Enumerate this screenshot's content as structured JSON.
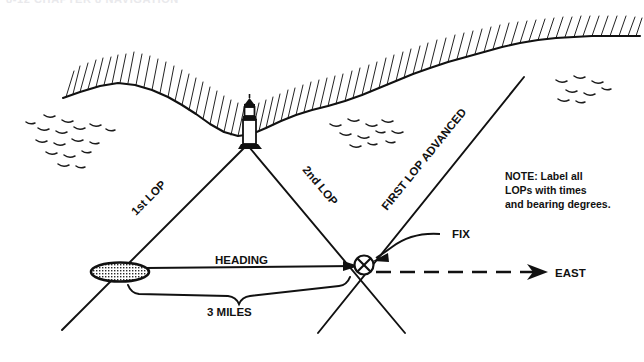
{
  "page": {
    "cut_header": "8-12   CHAPTER 8  NAVIGATION",
    "background_color": "#ffffff",
    "ink_color": "#111111"
  },
  "diagram": {
    "labels": {
      "lop1": "1st LOP",
      "lop2": "2nd LOP",
      "lop_advanced": "FIRST LOP ADVANCED",
      "heading": "HEADING",
      "distance": "3 MILES",
      "fix": "FIX",
      "east": "EAST"
    },
    "note": {
      "line1": "NOTE: Label all",
      "line2": "LOPs with times",
      "line3": "and bearing degrees."
    },
    "features": {
      "lighthouse": "lighthouse-icon",
      "ship": "ship-icon",
      "fix_symbol": "fix-circle-x-icon",
      "coastline": "coastline-shape",
      "water": "water-ripples",
      "east_arrow": "east-arrow-icon",
      "brace": "distance-brace"
    }
  }
}
